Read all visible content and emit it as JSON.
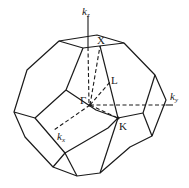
{
  "figure": {
    "background": "#ffffff",
    "line_color": "#1a1a1a"
  },
  "axes": {
    "kz": {
      "base": "k",
      "sub": "z"
    },
    "ky": {
      "base": "k",
      "sub": "y"
    },
    "kx": {
      "base": "k",
      "sub": "x"
    }
  },
  "points": {
    "gamma": "Γ",
    "x": "X",
    "l": "L",
    "k": "K"
  }
}
